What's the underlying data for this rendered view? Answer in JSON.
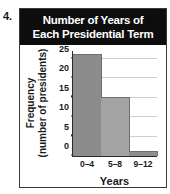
{
  "problem": {
    "number": "4."
  },
  "figure": {
    "title_lines": [
      "Number of Years of",
      "Each Presidential Term"
    ],
    "title_bg": "#0d0d0d",
    "title_color": "#ffffff",
    "frame_color": "#3a3a3a"
  },
  "chart_data": {
    "type": "bar",
    "title": "Number of Years of Each Presidential Term",
    "categories": [
      "0–4",
      "5–8",
      "9–12"
    ],
    "values": [
      26,
      15,
      1
    ],
    "xlabel": "Years",
    "ylabel": "Frequency (number of presidents)",
    "ylabel_lines": [
      "Frequency",
      "(number of presidents)"
    ],
    "ylim": [
      0,
      27
    ],
    "yticks": [
      0,
      5,
      10,
      15,
      20,
      25
    ],
    "ytick_labels": [
      "0",
      "5",
      "10",
      "15",
      "20",
      "25"
    ],
    "grid": true,
    "grid_color": "#cfcfcf",
    "legend": false,
    "bar_colors": [
      "#8c8c8c",
      "#a3a3a3",
      "#8f8f8f"
    ],
    "axis_color": "#2b2b2b"
  }
}
